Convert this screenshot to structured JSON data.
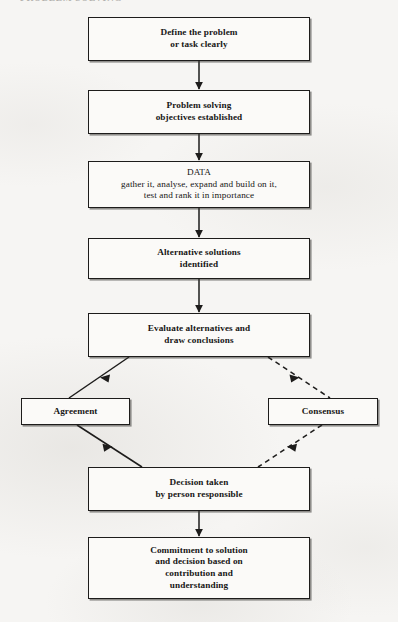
{
  "document": {
    "type": "flowchart",
    "subject": "Problem solving and decision making process",
    "header_fragment": "PROBLEM SOLVING",
    "background_color": "#f6f5f3",
    "ink_color": "#1d1c1b"
  },
  "nodes": [
    {
      "id": "define-problem",
      "label": "Define the problem\nor task clearly",
      "style": "bold",
      "x": 88,
      "y": 17,
      "width": 222,
      "height": 44
    },
    {
      "id": "objectives",
      "label": "Problem solving\nobjectives established",
      "style": "bold",
      "x": 88,
      "y": 90,
      "width": 222,
      "height": 44
    },
    {
      "id": "data",
      "label": "DATA\ngather it, analyse, expand and build on it,\ntest and rank it in importance",
      "style": "plain",
      "x": 88,
      "y": 161,
      "width": 222,
      "height": 47
    },
    {
      "id": "alternative-solutions",
      "label": "Alternative solutions\nidentified",
      "style": "bold",
      "x": 88,
      "y": 238,
      "width": 222,
      "height": 41
    },
    {
      "id": "evaluate-alternatives",
      "label": "Evaluate alternatives and\ndraw conclusions",
      "style": "bold",
      "x": 88,
      "y": 313,
      "width": 222,
      "height": 44
    },
    {
      "id": "agreement",
      "label": "Agreement",
      "style": "bold",
      "x": 21,
      "y": 398,
      "width": 109,
      "height": 27
    },
    {
      "id": "consensus",
      "label": "Consensus",
      "style": "bold",
      "x": 268,
      "y": 398,
      "width": 110,
      "height": 27
    },
    {
      "id": "decision-taken",
      "label": "Decision taken\nby person responsible",
      "style": "bold",
      "x": 88,
      "y": 467,
      "width": 222,
      "height": 44
    },
    {
      "id": "commitment",
      "label": "Commitment to solution\nand decision based on\ncontribution and\nunderstanding",
      "style": "bold",
      "x": 88,
      "y": 537,
      "width": 222,
      "height": 62
    }
  ],
  "connectors": [
    {
      "id": "define-to-objectives",
      "from": "define-problem",
      "to": "objectives",
      "style": "solid",
      "direction": "down"
    },
    {
      "id": "objectives-to-data",
      "from": "objectives",
      "to": "data",
      "style": "solid",
      "direction": "down"
    },
    {
      "id": "data-to-alternatives",
      "from": "data",
      "to": "alternative-solutions",
      "style": "solid",
      "direction": "down"
    },
    {
      "id": "alternatives-to-evaluate",
      "from": "alternative-solutions",
      "to": "evaluate-alternatives",
      "style": "solid",
      "direction": "down"
    },
    {
      "id": "evaluate-to-agreement",
      "from": "evaluate-alternatives",
      "to": "agreement",
      "style": "solid",
      "direction": "down-left"
    },
    {
      "id": "evaluate-to-consensus",
      "from": "evaluate-alternatives",
      "to": "consensus",
      "style": "dashed",
      "direction": "down-right"
    },
    {
      "id": "agreement-to-decision",
      "from": "agreement",
      "to": "decision-taken",
      "style": "solid",
      "direction": "down-right"
    },
    {
      "id": "consensus-to-decision",
      "from": "consensus",
      "to": "decision-taken",
      "style": "dashed",
      "direction": "down-left"
    },
    {
      "id": "decision-to-commitment",
      "from": "decision-taken",
      "to": "commitment",
      "style": "solid",
      "direction": "down"
    }
  ]
}
